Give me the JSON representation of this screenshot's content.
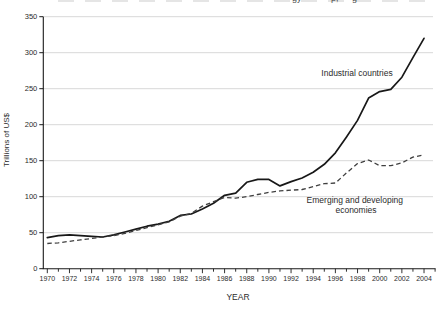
{
  "clipped_top_caption": {
    "visible_fragments": [
      "gy",
      "p,",
      "g"
    ]
  },
  "chart_data": {
    "type": "line",
    "title": "",
    "xlabel": "YEAR",
    "ylabel": "Trillions of US$",
    "ylim": [
      0,
      350
    ],
    "y_ticks": [
      0,
      50,
      100,
      150,
      200,
      250,
      300,
      350
    ],
    "x_tick_labels": [
      1970,
      1972,
      1974,
      1976,
      1978,
      1980,
      1982,
      1984,
      1986,
      1988,
      1990,
      1992,
      1994,
      1996,
      1998,
      2000,
      2002,
      2004
    ],
    "x_axis_year_max": 2005,
    "grid": true,
    "legend": "inline-labels",
    "x": [
      1970,
      1971,
      1972,
      1973,
      1974,
      1975,
      1976,
      1977,
      1978,
      1979,
      1980,
      1981,
      1982,
      1983,
      1984,
      1985,
      1986,
      1987,
      1988,
      1989,
      1990,
      1991,
      1992,
      1993,
      1994,
      1995,
      1996,
      1997,
      1998,
      1999,
      2000,
      2001,
      2002,
      2003,
      2004
    ],
    "series": [
      {
        "name": "Industrial countries",
        "line_style": "solid",
        "color": "#181818",
        "label_lines": [
          "Industrial countries"
        ],
        "values": [
          43,
          46,
          47,
          46,
          45,
          44,
          47,
          51,
          55,
          59,
          62,
          66,
          74,
          76,
          83,
          91,
          102,
          105,
          120,
          124,
          124,
          115,
          121,
          126,
          134,
          145,
          161,
          183,
          206,
          237,
          246,
          249,
          266,
          293,
          320
        ]
      },
      {
        "name": "Emerging and developing economies",
        "line_style": "dashed",
        "color": "#3f3f3f",
        "label_lines": [
          "Emerging and developing",
          "economies"
        ],
        "values": [
          35,
          36,
          38,
          40,
          42,
          44,
          46,
          49,
          53,
          57,
          61,
          65,
          73,
          77,
          87,
          93,
          99,
          98,
          100,
          103,
          106,
          108,
          109,
          110,
          114,
          118,
          119,
          133,
          146,
          151,
          143,
          143,
          147,
          155,
          158
        ]
      }
    ]
  }
}
